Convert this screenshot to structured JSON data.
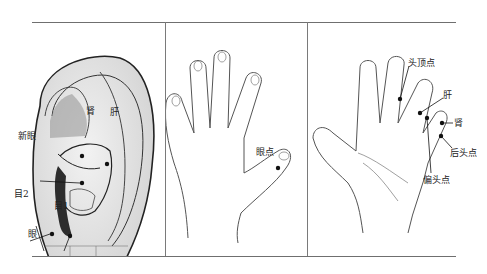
{
  "figure": {
    "panels": [
      {
        "id": "ear",
        "title": "耳穴",
        "points": [
          {
            "label": "肾"
          },
          {
            "label": "肝"
          },
          {
            "label": "新眼"
          },
          {
            "label": "目2"
          },
          {
            "label": "目1"
          },
          {
            "label": "眼"
          }
        ]
      },
      {
        "id": "hand-back",
        "title": "手背",
        "points": [
          {
            "label": "眼点"
          }
        ]
      },
      {
        "id": "hand-palm",
        "title": "手掌",
        "points": [
          {
            "label": "头顶点"
          },
          {
            "label": "肝"
          },
          {
            "label": "肾"
          },
          {
            "label": "后头点"
          },
          {
            "label": "偏头点"
          }
        ]
      }
    ],
    "colors": {
      "line": "#2a2a2a",
      "rule": "#6f6f6f",
      "ear_fill": "#e4e4e4",
      "ear_shadow": "#8a8a8a",
      "point": "#111111"
    }
  }
}
